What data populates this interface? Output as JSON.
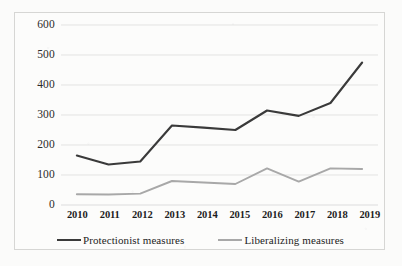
{
  "chart_data": {
    "type": "line",
    "title": "",
    "xlabel": "",
    "ylabel": "",
    "categories": [
      "2010",
      "2011",
      "2012",
      "2013",
      "2014",
      "2015",
      "2016",
      "2017",
      "2018",
      "2019"
    ],
    "series": [
      {
        "name": "Protectionist measures",
        "color": "#3a3a3a",
        "values": [
          165,
          135,
          145,
          265,
          258,
          250,
          315,
          297,
          340,
          475
        ]
      },
      {
        "name": "Liberalizing measures",
        "color": "#a8a8a8",
        "values": [
          36,
          35,
          38,
          80,
          75,
          70,
          122,
          78,
          122,
          120
        ]
      }
    ],
    "ylim": [
      0,
      600
    ],
    "ytick_step": 100,
    "yticks": [
      "600",
      "500",
      "400",
      "300",
      "200",
      "100",
      "0"
    ],
    "grid": true,
    "grid_color": "#d9d9d9",
    "legend_position": "bottom",
    "background": "#fcfcfb",
    "border_color": "#d6d6d4"
  }
}
